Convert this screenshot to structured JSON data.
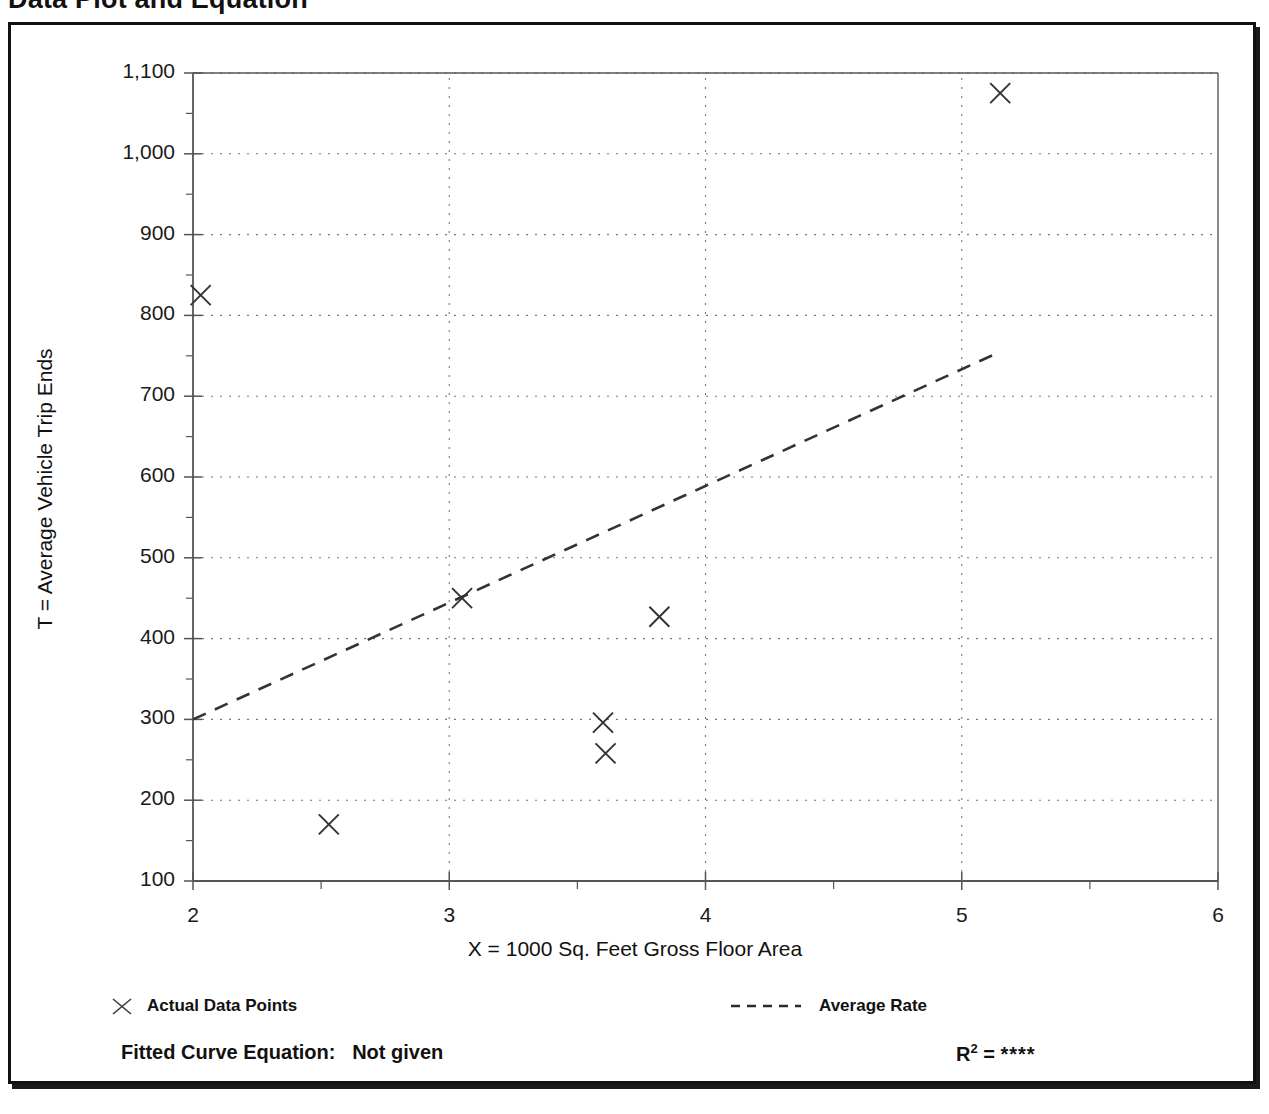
{
  "page": {
    "title": "Data Plot and Equation"
  },
  "chart_data": {
    "type": "scatter",
    "title": "Data Plot and Equation",
    "xlabel": "X = 1000 Sq. Feet Gross Floor Area",
    "ylabel": "T = Average Vehicle Trip Ends",
    "xlim": [
      2,
      6
    ],
    "ylim": [
      100,
      1100
    ],
    "xticks": [
      "2",
      "3",
      "4",
      "5",
      "6"
    ],
    "xtick_values": [
      2,
      3,
      4,
      5,
      6
    ],
    "xminor_step": 0.5,
    "yticks": [
      "100",
      "200",
      "300",
      "400",
      "500",
      "600",
      "700",
      "800",
      "900",
      "1,000",
      "1,100"
    ],
    "ytick_values": [
      100,
      200,
      300,
      400,
      500,
      600,
      700,
      800,
      900,
      1000,
      1100
    ],
    "yminor_step": 50,
    "grid": "dotted",
    "grid_x_values": [
      3,
      4,
      5
    ],
    "series": [
      {
        "name": "Actual Data Points",
        "type": "scatter",
        "marker": "x",
        "points": [
          {
            "x": 2.03,
            "y": 825
          },
          {
            "x": 2.53,
            "y": 170
          },
          {
            "x": 3.05,
            "y": 450
          },
          {
            "x": 3.6,
            "y": 296
          },
          {
            "x": 3.61,
            "y": 258
          },
          {
            "x": 3.82,
            "y": 427
          },
          {
            "x": 5.15,
            "y": 1075
          }
        ]
      },
      {
        "name": "Average Rate",
        "type": "line",
        "style": "dashed",
        "points": [
          {
            "x": 2.0,
            "y": 300
          },
          {
            "x": 5.15,
            "y": 755
          }
        ]
      }
    ],
    "legend_position": "below-axes"
  },
  "legend": {
    "data_points_label": "Actual Data Points",
    "average_rate_label": "Average Rate",
    "data_points_marker": "x-marker-icon",
    "average_rate_marker": "dashed-line-icon"
  },
  "footer": {
    "fitted_equation_label": "Fitted Curve Equation:",
    "fitted_equation_value": "Not given",
    "r_squared_label": "R",
    "r_squared_exponent": "2",
    "r_squared_equals": "=",
    "r_squared_value": "****"
  },
  "colors": {
    "frame": "#111111",
    "axis": "#555555",
    "grid": "#777777",
    "marker": "#333333",
    "trendline": "#333333",
    "background": "#ffffff"
  }
}
